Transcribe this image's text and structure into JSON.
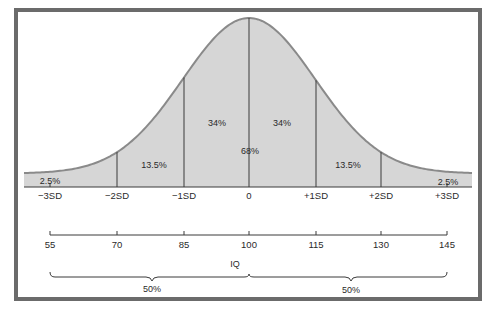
{
  "chart_data": {
    "type": "area",
    "title": "",
    "subtitle": "",
    "xlabel": "IQ",
    "ylabel": "",
    "grid": false,
    "legend": null,
    "sd_labels": [
      "−3SD",
      "−2SD",
      "−1SD",
      "0",
      "+1SD",
      "+2SD",
      "+3SD"
    ],
    "iq_ticks": [
      55,
      70,
      85,
      100,
      115,
      130,
      145
    ],
    "mean": 100,
    "sd": 15,
    "regions": [
      {
        "range": "<-2SD",
        "label": "2.5%",
        "value": 2.5
      },
      {
        "range": "-2SD to -1SD",
        "label": "13.5%",
        "value": 13.5
      },
      {
        "range": "-1SD to 0",
        "label": "34%",
        "value": 34
      },
      {
        "range": "0 to +1SD",
        "label": "34%",
        "value": 34
      },
      {
        "range": "+1SD to +2SD",
        "label": "13.5%",
        "value": 13.5
      },
      {
        "range": ">+2SD",
        "label": "2.5%",
        "value": 2.5
      }
    ],
    "center_label": {
      "range": "-1SD to +1SD",
      "label": "68%",
      "value": 68
    },
    "halves": [
      {
        "range": "55-100",
        "label": "50%",
        "value": 50
      },
      {
        "range": "100-145",
        "label": "50%",
        "value": 50
      }
    ],
    "colors": {
      "fill": "#d4d4d4",
      "curve": "#8a8a8a",
      "line": "#3a3a3a",
      "frame": "#6b6b6b"
    }
  },
  "labels": {
    "sd": [
      "−3SD",
      "−2SD",
      "−1SD",
      "0",
      "+1SD",
      "+2SD",
      "+3SD"
    ],
    "iq": [
      "55",
      "70",
      "85",
      "100",
      "115",
      "130",
      "145"
    ],
    "axis_title": "IQ",
    "pct_tail_left": "2.5%",
    "pct_2_left": "13.5%",
    "pct_1_left": "34%",
    "pct_1_right": "34%",
    "pct_2_right": "13.5%",
    "pct_tail_right": "2.5%",
    "pct_center": "68%",
    "half_left": "50%",
    "half_right": "50%"
  }
}
